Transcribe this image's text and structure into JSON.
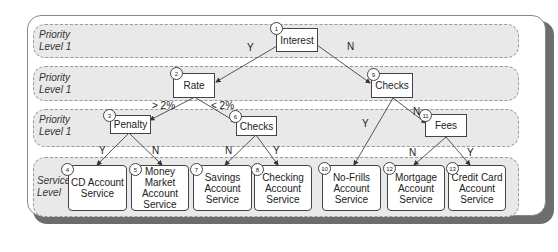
{
  "lanes": [
    {
      "label_line1": "Priority",
      "label_line2": "Level 1"
    },
    {
      "label_line1": "Priority",
      "label_line2": "Level 1"
    },
    {
      "label_line1": "Priority",
      "label_line2": "Level 1"
    },
    {
      "label_line1": "Service",
      "label_line2": "Level"
    }
  ],
  "nodes": {
    "n1": {
      "num": "1",
      "label": "Interest"
    },
    "n2": {
      "num": "2",
      "label": "Rate"
    },
    "n3": {
      "num": "3",
      "label": "Penalty"
    },
    "n4": {
      "num": "4",
      "label": "CD Account Service"
    },
    "n5": {
      "num": "5",
      "label": "Money Market Account Service"
    },
    "n6": {
      "num": "6",
      "label": "Checks"
    },
    "n7": {
      "num": "7",
      "label": "Savings Account Service"
    },
    "n8": {
      "num": "8",
      "label": "Checking Account Service"
    },
    "n9": {
      "num": "9",
      "label": "Checks"
    },
    "n10": {
      "num": "10",
      "label": "No-Frills Account Service"
    },
    "n11": {
      "num": "11",
      "label": "Fees"
    },
    "n12": {
      "num": "12",
      "label": "Mortgage Account Service"
    },
    "n13": {
      "num": "13",
      "label": "Credit Card Account Service"
    }
  },
  "edges": {
    "e1_2": "Y",
    "e1_9": "N",
    "e2_3": "> 2%",
    "e2_6": "< 2%",
    "e3_4": "Y",
    "e3_5": "N",
    "e6_7": "N",
    "e6_8": "Y",
    "e9_10": "Y",
    "e9_11": "N",
    "e11_12": "N",
    "e11_13": "Y"
  }
}
